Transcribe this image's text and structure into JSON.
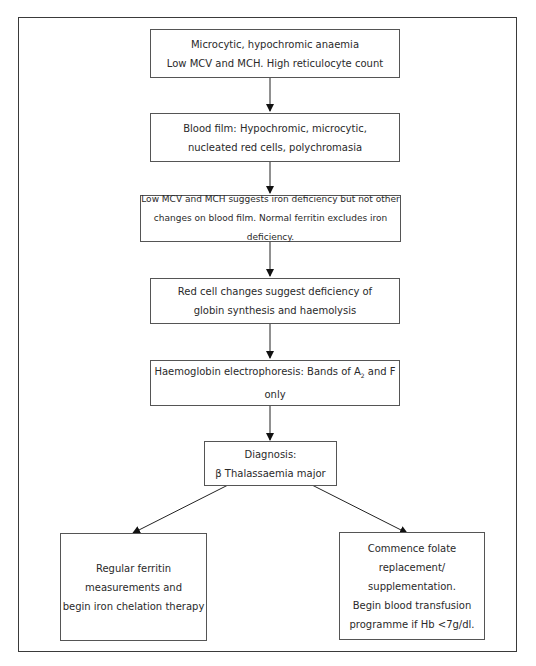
{
  "diagram": {
    "nodes": [
      {
        "id": "n1",
        "lines": [
          "Microcytic, hypochromic anaemia",
          "Low MCV and MCH. High reticulocyte count"
        ]
      },
      {
        "id": "n2",
        "lines": [
          "Blood film: Hypochromic, microcytic,",
          "nucleated red cells, polychromasia"
        ]
      },
      {
        "id": "n3",
        "lines": [
          "Low MCV and MCH suggests iron deficiency but not other",
          "changes on blood film. Normal ferritin excludes iron deficiency."
        ]
      },
      {
        "id": "n4",
        "lines": [
          "Red cell changes suggest deficiency of",
          "globin synthesis and haemolysis"
        ]
      },
      {
        "id": "n5",
        "lines": [
          "Haemoglobin electrophoresis: Bands of A",
          "2",
          " and F only"
        ]
      },
      {
        "id": "n6",
        "lines": [
          "Diagnosis:",
          "β Thalassaemia major"
        ]
      },
      {
        "id": "n7",
        "lines": [
          "Regular ferritin",
          "measurements and",
          "begin iron chelation therapy"
        ]
      },
      {
        "id": "n8",
        "lines": [
          "Commence folate replacement/",
          "supplementation.",
          "Begin blood transfusion",
          "programme if Hb <7g/dl."
        ]
      }
    ],
    "edges": [
      {
        "from": "n1",
        "to": "n2"
      },
      {
        "from": "n2",
        "to": "n3"
      },
      {
        "from": "n3",
        "to": "n4"
      },
      {
        "from": "n4",
        "to": "n5"
      },
      {
        "from": "n5",
        "to": "n6"
      },
      {
        "from": "n6",
        "to": "n7"
      },
      {
        "from": "n6",
        "to": "n8"
      }
    ]
  }
}
